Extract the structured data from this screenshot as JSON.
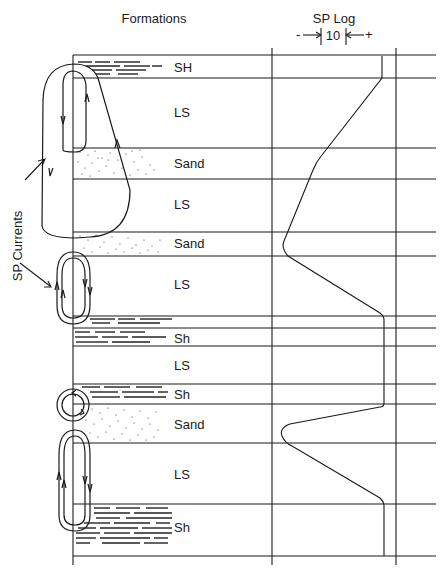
{
  "header": {
    "formations_title": "Formations",
    "sp_log_title": "SP Log",
    "scale_minus": "-",
    "scale_value": "10",
    "scale_plus": "+"
  },
  "side_label": "SP Currents",
  "layers": [
    {
      "name": "SH",
      "lithology": "shale",
      "top": 55,
      "bottom": 78
    },
    {
      "name": "LS",
      "lithology": "limestone",
      "top": 78,
      "bottom": 148
    },
    {
      "name": "Sand",
      "lithology": "sand",
      "top": 148,
      "bottom": 179
    },
    {
      "name": "LS",
      "lithology": "limestone",
      "top": 179,
      "bottom": 232
    },
    {
      "name": "Sand",
      "lithology": "sand",
      "top": 232,
      "bottom": 256
    },
    {
      "name": "LS",
      "lithology": "limestone",
      "top": 256,
      "bottom": 316
    },
    {
      "name": "",
      "lithology": "shale",
      "top": 316,
      "bottom": 328
    },
    {
      "name": "Sh",
      "lithology": "shale",
      "top": 328,
      "bottom": 346
    },
    {
      "name": "LS",
      "lithology": "limestone",
      "top": 346,
      "bottom": 384
    },
    {
      "name": "Sh",
      "lithology": "shale",
      "top": 384,
      "bottom": 404
    },
    {
      "name": "Sand",
      "lithology": "sand",
      "top": 404,
      "bottom": 443
    },
    {
      "name": "LS",
      "lithology": "limestone",
      "top": 443,
      "bottom": 504
    },
    {
      "name": "Sh",
      "lithology": "shale",
      "top": 504,
      "bottom": 556
    }
  ],
  "colors": {
    "line": "#1a1a1a",
    "background": "#ffffff"
  }
}
